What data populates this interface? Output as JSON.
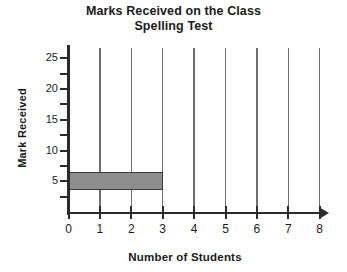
{
  "chart_data": {
    "type": "bar",
    "orientation": "horizontal",
    "title": "Marks Received on the Class Spelling Test",
    "title_line1": "Marks Received on the Class",
    "title_line2": "Spelling Test",
    "xlabel": "Number of Students",
    "ylabel": "Mark Received",
    "xlim": [
      0,
      8
    ],
    "ylim": [
      0,
      27
    ],
    "xticks": [
      "0",
      "1",
      "2",
      "3",
      "4",
      "5",
      "6",
      "7",
      "8"
    ],
    "yticks": [
      "5",
      "10",
      "15",
      "20",
      "25"
    ],
    "grid": "vertical",
    "legend": "none",
    "categories": [
      "5"
    ],
    "values": [
      3
    ],
    "bars": [
      {
        "mark": 5,
        "students": 3,
        "color": "#8e8e8e"
      }
    ],
    "bar_color": "#8e8e8e",
    "bar_edge_color": "#3a3a3a",
    "axis_color": "#2b2b2b",
    "gridline_color": "#6f6f6f"
  }
}
